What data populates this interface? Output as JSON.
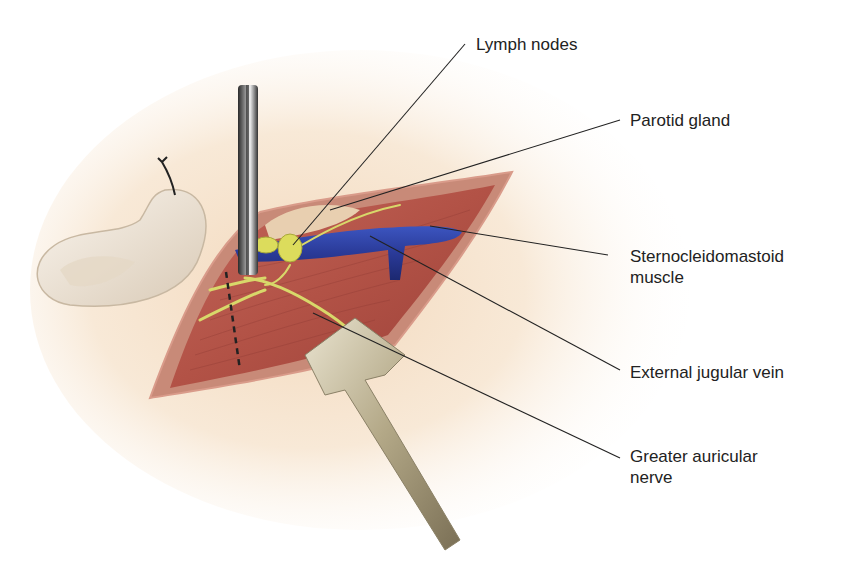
{
  "figure": {
    "labels": [
      {
        "id": "lymph-nodes",
        "lines": [
          "Lymph nodes"
        ],
        "x": 476,
        "y": 34
      },
      {
        "id": "parotid-gland",
        "lines": [
          "Parotid gland"
        ],
        "x": 630,
        "y": 110
      },
      {
        "id": "sternocleidomastoid-muscle",
        "lines": [
          "Sternocleidomastoid",
          "muscle"
        ],
        "x": 630,
        "y": 246
      },
      {
        "id": "external-jugular-vein",
        "lines": [
          "External jugular vein"
        ],
        "x": 630,
        "y": 362
      },
      {
        "id": "greater-auricular-nerve",
        "lines": [
          "Greater auricular",
          "nerve"
        ],
        "x": 630,
        "y": 446
      }
    ],
    "colors": {
      "skin": "#f6e3cc",
      "muscle": "#b5544a",
      "muscle_dark": "#8e3a33",
      "vein": "#2d3f9e",
      "nerve": "#d8d86a",
      "retractor": "#c9c0a4",
      "hook": "#4a4a4a",
      "leader_line": "#222222",
      "ear": "#efe6da"
    }
  }
}
